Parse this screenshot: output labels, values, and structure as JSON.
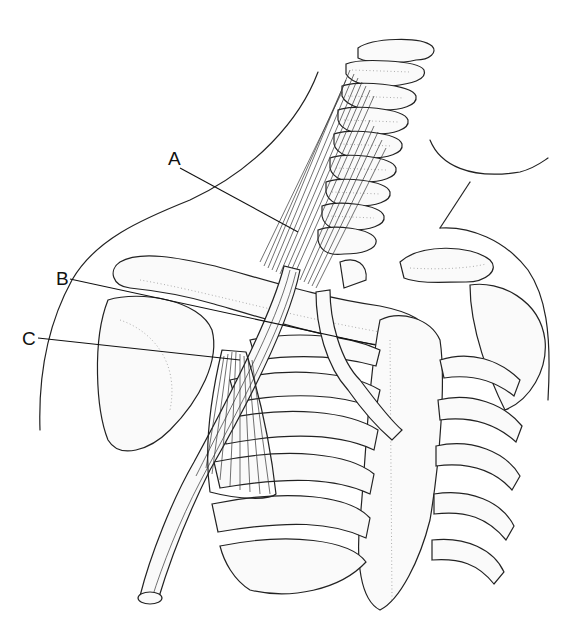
{
  "figure": {
    "background": "#ffffff",
    "ink_color": "#222222"
  },
  "labels": [
    {
      "id": "A",
      "text": "A",
      "x": 168,
      "y": 165,
      "line": {
        "x1": 180,
        "y1": 168,
        "x2": 298,
        "y2": 232
      }
    },
    {
      "id": "B",
      "text": "B",
      "x": 56,
      "y": 282,
      "line": {
        "x1": 70,
        "y1": 279,
        "x2": 375,
        "y2": 345
      }
    },
    {
      "id": "C",
      "text": "C",
      "x": 24,
      "y": 341,
      "line": {
        "x1": 38,
        "y1": 338,
        "x2": 240,
        "y2": 360
      }
    }
  ]
}
